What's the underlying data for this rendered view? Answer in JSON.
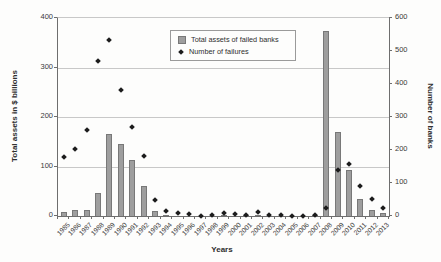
{
  "figure": {
    "legend": {
      "items": [
        {
          "label": "Total assets of failed banks",
          "marker": "square",
          "color": "#9e9e9e"
        },
        {
          "label": "Number of failures",
          "marker": "diamond",
          "color": "#1c1c1c"
        }
      ]
    },
    "colors": {
      "bar_fill": "#9e9e9e",
      "bar_border": "#787878",
      "marker": "#1c1c1c",
      "gridline": "#c8c8c8",
      "axis": "#6e6e6e",
      "text": "#333333",
      "background": "#fdfdfc"
    }
  },
  "chart_data": {
    "type": "bar",
    "title": "",
    "xlabel": "Years",
    "ylabel_left": "Total assets in $ billions",
    "ylabel_right": "Number of banks",
    "ylim_left": [
      0,
      400
    ],
    "ylim_right": [
      0,
      600
    ],
    "yticks_left": [
      0,
      100,
      200,
      300,
      400
    ],
    "yticks_right": [
      0,
      100,
      200,
      300,
      400,
      500,
      600
    ],
    "grid": true,
    "legend_position": "top-center-inside",
    "categories": [
      "1985",
      "1986",
      "1987",
      "1988",
      "1989",
      "1990",
      "1991",
      "1992",
      "1993",
      "1994",
      "1995",
      "1996",
      "1997",
      "1998",
      "1999",
      "2000",
      "2001",
      "2002",
      "2003",
      "2004",
      "2005",
      "2006",
      "2007",
      "2008",
      "2009",
      "2010",
      "2011",
      "2012",
      "2013"
    ],
    "series": [
      {
        "name": "Total assets of failed banks",
        "type": "bar",
        "axis": "left",
        "values": [
          9,
          13,
          13,
          47,
          165,
          146,
          113,
          60,
          10,
          1.5,
          1,
          0.5,
          0.2,
          0.5,
          1.5,
          0.5,
          2.5,
          3,
          1,
          0.3,
          0,
          0,
          2.5,
          373,
          170,
          93,
          35,
          12,
          6
        ]
      },
      {
        "name": "Number of failures",
        "type": "scatter",
        "axis": "right",
        "values": [
          180,
          204,
          262,
          470,
          534,
          382,
          271,
          181,
          50,
          15,
          8,
          6,
          1,
          3,
          8,
          7,
          4,
          11,
          3,
          4,
          0,
          0,
          3,
          25,
          140,
          157,
          92,
          51,
          24
        ]
      }
    ]
  }
}
